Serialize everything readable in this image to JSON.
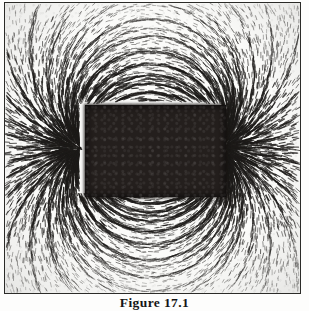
{
  "figure": {
    "caption": "Figure 17.1",
    "media": "scanned halftone photograph",
    "frame": {
      "border_color": "#2b2b28",
      "plate_background": "#fbfbf9"
    },
    "magnet": {
      "label": "bar magnet",
      "shape": "rectangle",
      "fill_color": "#241f1d",
      "left_px": 80,
      "top_px": 102,
      "width_px": 141,
      "height_px": 92
    },
    "filings": {
      "label": "iron filings",
      "stroke_color": "#1c1a18",
      "pattern": "dipole field lines",
      "pole_left": {
        "x_px": 80,
        "y_px": 148
      },
      "pole_right": {
        "x_px": 221,
        "y_px": 148
      }
    }
  }
}
